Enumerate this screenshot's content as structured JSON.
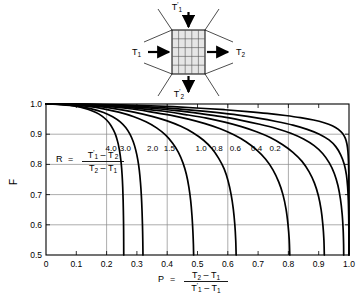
{
  "diagram": {
    "name": "crossflow-heat-exchanger-schematic",
    "inlet_top_label": "T'1",
    "inlet_left_label": "T1",
    "outlet_right_label": "T2",
    "outlet_bottom_label": "T'2",
    "grid_rows": 5,
    "grid_cols": 5
  },
  "chart_data": {
    "type": "line",
    "title": "",
    "xlabel": "P = (T2 - T1)/(T'1 - T1)",
    "ylabel": "F",
    "xlim": [
      0,
      1.0
    ],
    "ylim": [
      0.5,
      1.0
    ],
    "grid": true,
    "legend_position": "inline-curve-labels",
    "xticks": [
      "0",
      "0.1",
      "0.2",
      "0.3",
      "0.4",
      "0.5",
      "0.6",
      "0.7",
      "0.8",
      "0.9",
      "1.0"
    ],
    "xtick_values": [
      0,
      0.1,
      0.2,
      0.3,
      0.4,
      0.5,
      0.6,
      0.7,
      0.8,
      0.9,
      1.0
    ],
    "yticks": [
      "0.5",
      "0.6",
      "0.7",
      "0.8",
      "0.9",
      "1.0"
    ],
    "ytick_values": [
      0.5,
      0.6,
      0.7,
      0.8,
      0.9,
      1.0
    ],
    "xgridlines": [
      0.2,
      0.4,
      0.6,
      0.8
    ],
    "ygridlines": [
      0.6,
      0.7,
      0.8,
      0.9
    ],
    "series": [
      {
        "name": "4.0",
        "label": "4.0",
        "label_x": 0.215,
        "label_y": 0.843,
        "points": [
          [
            0.0,
            1.0
          ],
          [
            0.02,
            0.9995
          ],
          [
            0.05,
            0.998
          ],
          [
            0.08,
            0.995
          ],
          [
            0.11,
            0.99
          ],
          [
            0.14,
            0.982
          ],
          [
            0.165,
            0.972
          ],
          [
            0.185,
            0.96
          ],
          [
            0.2,
            0.947
          ],
          [
            0.212,
            0.932
          ],
          [
            0.222,
            0.915
          ],
          [
            0.23,
            0.897
          ],
          [
            0.236,
            0.877
          ],
          [
            0.241,
            0.855
          ],
          [
            0.245,
            0.83
          ],
          [
            0.2485,
            0.8
          ],
          [
            0.2512,
            0.765
          ],
          [
            0.2532,
            0.725
          ],
          [
            0.2546,
            0.68
          ],
          [
            0.2556,
            0.63
          ],
          [
            0.2562,
            0.58
          ],
          [
            0.2566,
            0.5
          ]
        ]
      },
      {
        "name": "3.0",
        "label": "3.0",
        "label_x": 0.262,
        "label_y": 0.843,
        "points": [
          [
            0.0,
            1.0
          ],
          [
            0.03,
            0.9993
          ],
          [
            0.07,
            0.997
          ],
          [
            0.11,
            0.992
          ],
          [
            0.15,
            0.984
          ],
          [
            0.19,
            0.972
          ],
          [
            0.22,
            0.958
          ],
          [
            0.245,
            0.941
          ],
          [
            0.263,
            0.922
          ],
          [
            0.277,
            0.9
          ],
          [
            0.288,
            0.875
          ],
          [
            0.296,
            0.848
          ],
          [
            0.303,
            0.815
          ],
          [
            0.308,
            0.78
          ],
          [
            0.3118,
            0.74
          ],
          [
            0.3148,
            0.695
          ],
          [
            0.317,
            0.645
          ],
          [
            0.3185,
            0.595
          ],
          [
            0.3195,
            0.545
          ],
          [
            0.32,
            0.5
          ]
        ]
      },
      {
        "name": "2.0",
        "label": "2.0",
        "label_x": 0.352,
        "label_y": 0.843,
        "points": [
          [
            0.0,
            1.0
          ],
          [
            0.04,
            0.9993
          ],
          [
            0.09,
            0.997
          ],
          [
            0.14,
            0.992
          ],
          [
            0.19,
            0.984
          ],
          [
            0.24,
            0.973
          ],
          [
            0.29,
            0.958
          ],
          [
            0.33,
            0.941
          ],
          [
            0.365,
            0.921
          ],
          [
            0.395,
            0.897
          ],
          [
            0.418,
            0.87
          ],
          [
            0.437,
            0.84
          ],
          [
            0.452,
            0.805
          ],
          [
            0.463,
            0.768
          ],
          [
            0.4715,
            0.725
          ],
          [
            0.4775,
            0.68
          ],
          [
            0.4818,
            0.63
          ],
          [
            0.4848,
            0.578
          ],
          [
            0.4865,
            0.535
          ],
          [
            0.4872,
            0.5
          ]
        ]
      },
      {
        "name": "1.5",
        "label": "1.5",
        "label_x": 0.407,
        "label_y": 0.843,
        "points": [
          [
            0.0,
            1.0
          ],
          [
            0.05,
            0.9993
          ],
          [
            0.11,
            0.997
          ],
          [
            0.17,
            0.992
          ],
          [
            0.23,
            0.984
          ],
          [
            0.29,
            0.973
          ],
          [
            0.35,
            0.959
          ],
          [
            0.4,
            0.944
          ],
          [
            0.445,
            0.926
          ],
          [
            0.485,
            0.905
          ],
          [
            0.52,
            0.88
          ],
          [
            0.548,
            0.852
          ],
          [
            0.57,
            0.82
          ],
          [
            0.588,
            0.785
          ],
          [
            0.601,
            0.745
          ],
          [
            0.611,
            0.7
          ],
          [
            0.6182,
            0.652
          ],
          [
            0.6232,
            0.6
          ],
          [
            0.6262,
            0.548
          ],
          [
            0.6275,
            0.5
          ]
        ]
      },
      {
        "name": "1.0",
        "label": "1.0",
        "label_x": 0.512,
        "label_y": 0.843,
        "points": [
          [
            0.0,
            1.0
          ],
          [
            0.06,
            0.9993
          ],
          [
            0.13,
            0.997
          ],
          [
            0.2,
            0.992
          ],
          [
            0.27,
            0.985
          ],
          [
            0.34,
            0.975
          ],
          [
            0.41,
            0.963
          ],
          [
            0.47,
            0.95
          ],
          [
            0.525,
            0.935
          ],
          [
            0.575,
            0.918
          ],
          [
            0.62,
            0.898
          ],
          [
            0.66,
            0.875
          ],
          [
            0.695,
            0.848
          ],
          [
            0.725,
            0.817
          ],
          [
            0.749,
            0.782
          ],
          [
            0.768,
            0.742
          ],
          [
            0.782,
            0.7
          ],
          [
            0.7922,
            0.652
          ],
          [
            0.7988,
            0.6
          ],
          [
            0.8028,
            0.55
          ],
          [
            0.8045,
            0.5
          ]
        ]
      },
      {
        "name": "0.8",
        "label": "0.8",
        "label_x": 0.565,
        "label_y": 0.843,
        "points": [
          [
            0.0,
            1.0
          ],
          [
            0.07,
            0.9993
          ],
          [
            0.15,
            0.997
          ],
          [
            0.23,
            0.992
          ],
          [
            0.31,
            0.985
          ],
          [
            0.39,
            0.976
          ],
          [
            0.46,
            0.965
          ],
          [
            0.53,
            0.953
          ],
          [
            0.59,
            0.94
          ],
          [
            0.645,
            0.925
          ],
          [
            0.695,
            0.908
          ],
          [
            0.74,
            0.889
          ],
          [
            0.78,
            0.866
          ],
          [
            0.815,
            0.84
          ],
          [
            0.845,
            0.81
          ],
          [
            0.868,
            0.776
          ],
          [
            0.886,
            0.738
          ],
          [
            0.899,
            0.696
          ],
          [
            0.908,
            0.65
          ],
          [
            0.9138,
            0.6
          ],
          [
            0.9172,
            0.55
          ],
          [
            0.9185,
            0.5
          ]
        ]
      },
      {
        "name": "0.6",
        "label": "0.6",
        "label_x": 0.625,
        "label_y": 0.843,
        "points": [
          [
            0.0,
            1.0
          ],
          [
            0.08,
            0.9993
          ],
          [
            0.17,
            0.997
          ],
          [
            0.26,
            0.992
          ],
          [
            0.35,
            0.986
          ],
          [
            0.43,
            0.978
          ],
          [
            0.51,
            0.968
          ],
          [
            0.58,
            0.958
          ],
          [
            0.645,
            0.946
          ],
          [
            0.705,
            0.933
          ],
          [
            0.76,
            0.919
          ],
          [
            0.808,
            0.903
          ],
          [
            0.85,
            0.884
          ],
          [
            0.885,
            0.862
          ],
          [
            0.913,
            0.836
          ],
          [
            0.935,
            0.805
          ],
          [
            0.9515,
            0.77
          ],
          [
            0.9635,
            0.73
          ],
          [
            0.9718,
            0.685
          ],
          [
            0.9775,
            0.635
          ],
          [
            0.9808,
            0.582
          ],
          [
            0.9822,
            0.535
          ],
          [
            0.9825,
            0.5
          ]
        ]
      },
      {
        "name": "0.4",
        "label": "0.4",
        "label_x": 0.695,
        "label_y": 0.843,
        "points": [
          [
            0.0,
            1.0
          ],
          [
            0.09,
            0.9994
          ],
          [
            0.19,
            0.997
          ],
          [
            0.29,
            0.993
          ],
          [
            0.39,
            0.987
          ],
          [
            0.48,
            0.98
          ],
          [
            0.56,
            0.972
          ],
          [
            0.635,
            0.963
          ],
          [
            0.7,
            0.953
          ],
          [
            0.76,
            0.942
          ],
          [
            0.815,
            0.93
          ],
          [
            0.862,
            0.916
          ],
          [
            0.902,
            0.9
          ],
          [
            0.934,
            0.881
          ],
          [
            0.957,
            0.858
          ],
          [
            0.973,
            0.831
          ],
          [
            0.9845,
            0.8
          ],
          [
            0.9915,
            0.765
          ],
          [
            0.9955,
            0.725
          ],
          [
            0.9978,
            0.68
          ],
          [
            0.999,
            0.63
          ],
          [
            0.9996,
            0.575
          ],
          [
            0.9999,
            0.5
          ]
        ]
      },
      {
        "name": "0.2",
        "label": "0.2",
        "label_x": 0.756,
        "label_y": 0.843,
        "points": [
          [
            0.0,
            1.0
          ],
          [
            0.1,
            0.9995
          ],
          [
            0.21,
            0.998
          ],
          [
            0.32,
            0.995
          ],
          [
            0.42,
            0.991
          ],
          [
            0.51,
            0.986
          ],
          [
            0.59,
            0.981
          ],
          [
            0.665,
            0.975
          ],
          [
            0.73,
            0.969
          ],
          [
            0.79,
            0.962
          ],
          [
            0.84,
            0.955
          ],
          [
            0.883,
            0.947
          ],
          [
            0.918,
            0.938
          ],
          [
            0.945,
            0.928
          ],
          [
            0.965,
            0.916
          ],
          [
            0.979,
            0.902
          ],
          [
            0.988,
            0.886
          ],
          [
            0.9935,
            0.866
          ],
          [
            0.9965,
            0.842
          ],
          [
            0.9982,
            0.812
          ],
          [
            0.9992,
            0.775
          ],
          [
            0.9997,
            0.725
          ],
          [
            0.9999,
            0.66
          ],
          [
            1.0,
            0.58
          ],
          [
            1.0,
            0.5
          ]
        ]
      }
    ],
    "r_formula": {
      "symbol": "R",
      "equals": "=",
      "numerator": "T'1 - T'2",
      "denominator": "T2 - T1"
    },
    "p_formula": {
      "symbol": "P",
      "equals": "=",
      "numerator": "T2 - T1",
      "denominator": "T'1 - T1"
    }
  }
}
